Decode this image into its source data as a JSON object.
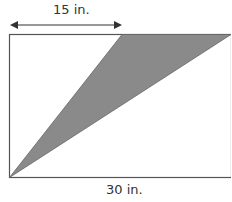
{
  "diagram": {
    "top_dimension": "15 in.",
    "bottom_dimension": "30 in.",
    "colors": {
      "shaded": "#8a8a8a",
      "line": "#444444"
    }
  }
}
